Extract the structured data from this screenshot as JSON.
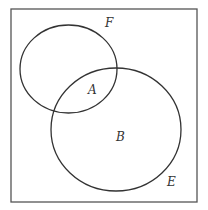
{
  "diagram": {
    "type": "venn",
    "universe_label": "E",
    "sets": [
      {
        "name": "F",
        "label": "F"
      },
      {
        "name": "B-circle",
        "label": "B"
      }
    ],
    "region_labels": {
      "intersection": "A",
      "large_only": "B",
      "small_set": "F",
      "universe": "E"
    },
    "colors": {
      "stroke": "#333333",
      "background": "#ffffff"
    }
  }
}
